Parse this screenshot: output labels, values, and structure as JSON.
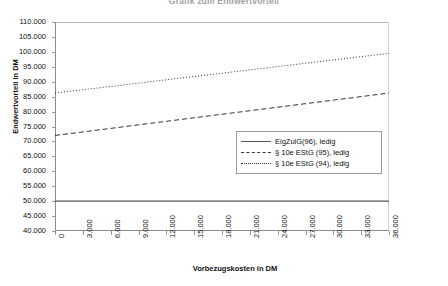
{
  "chart_data": {
    "type": "line",
    "title": "Grafik zum Endwertvorteil",
    "xlabel": "Vorbezugskosten in DM",
    "ylabel": "Endwertvorteil in DM",
    "xlim": [
      0,
      36000
    ],
    "ylim": [
      40000,
      110000
    ],
    "grid": false,
    "legend_position": "center-right inside plot",
    "x_ticks": [
      "0",
      "3.000",
      "6.000",
      "9.000",
      "12.000",
      "15.000",
      "18.000",
      "21.000",
      "24.000",
      "27.000",
      "30.000",
      "33.000",
      "36.000"
    ],
    "x_tick_values": [
      0,
      3000,
      6000,
      9000,
      12000,
      15000,
      18000,
      21000,
      24000,
      27000,
      30000,
      33000,
      36000
    ],
    "y_ticks": [
      "110.000",
      "105.000",
      "100.000",
      "95.000",
      "90.000",
      "85.000",
      "80.000",
      "75.000",
      "70.000",
      "65.000",
      "60.000",
      "55.000",
      "50.000",
      "45.000",
      "40.000"
    ],
    "y_tick_values": [
      110000,
      105000,
      100000,
      95000,
      90000,
      85000,
      80000,
      75000,
      70000,
      65000,
      60000,
      55000,
      50000,
      45000,
      40000
    ],
    "x": [
      0,
      36000
    ],
    "series": [
      {
        "name": "EigZulG(96), ledig",
        "style": "solid",
        "color": "#555555",
        "values": [
          50000,
          50000
        ]
      },
      {
        "name": "§ 10e EStG (95), ledig",
        "style": "dashed",
        "color": "#333333",
        "values": [
          72000,
          86200
        ]
      },
      {
        "name": "§ 10e EStG (94), ledig",
        "style": "dotted",
        "color": "#333333",
        "values": [
          86200,
          99500
        ]
      }
    ]
  },
  "legend": {
    "items": [
      {
        "label": "EigZulG(96), ledig",
        "style": "solid"
      },
      {
        "label": "§ 10e EStG (95), ledig",
        "style": "dashed"
      },
      {
        "label": "§ 10e EStG (94), ledig",
        "style": "dotted"
      }
    ]
  }
}
